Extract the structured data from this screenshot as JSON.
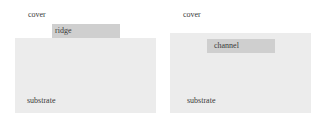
{
  "panels": [
    {
      "name": "ridge-panel",
      "cover_label": "cover",
      "feature_label": "ridge",
      "substrate_label": "substrate"
    },
    {
      "name": "channel-panel",
      "cover_label": "cover",
      "feature_label": "channel",
      "substrate_label": "substrate"
    }
  ],
  "colors": {
    "substrate": "#ececec",
    "feature": "#cfcfcf",
    "background": "#ffffff"
  }
}
